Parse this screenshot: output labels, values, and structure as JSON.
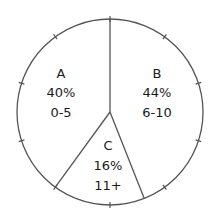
{
  "chart_data": {
    "type": "pie",
    "title": "",
    "start_angle_deg": 0,
    "direction": "clockwise",
    "tick_interval_percent": 10,
    "slices": [
      {
        "label": "B",
        "percent": 44,
        "range": "6-10",
        "percent_text": "44%"
      },
      {
        "label": "C",
        "percent": 16,
        "range": "11+",
        "percent_text": "16%"
      },
      {
        "label": "A",
        "percent": 40,
        "range": "0-5",
        "percent_text": "40%"
      }
    ],
    "categories": [
      "A",
      "B",
      "C"
    ],
    "values": [
      40,
      44,
      16
    ],
    "legend": []
  },
  "colors": {
    "stroke": "#555555",
    "fill": "#ffffff",
    "text": "#1a1a1a"
  },
  "labels": {
    "A": {
      "name": "A",
      "percent": "40%",
      "range": "0-5"
    },
    "B": {
      "name": "B",
      "percent": "44%",
      "range": "6-10"
    },
    "C": {
      "name": "C",
      "percent": "16%",
      "range": "11+"
    }
  }
}
